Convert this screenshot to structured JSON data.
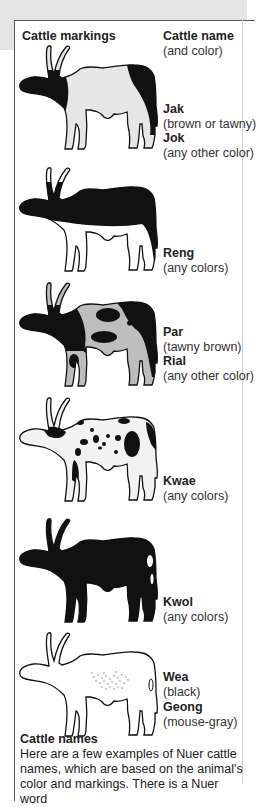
{
  "header": {
    "markings_label": "Cattle markings",
    "name_label": "Cattle name",
    "name_sublabel": "(and color)"
  },
  "cattle": [
    {
      "marking": "black head, neck, and rump with white body",
      "names": [
        {
          "name": "Jak",
          "color": "(brown or tawny)"
        },
        {
          "name": "Jok",
          "color": "(any other color)"
        }
      ]
    },
    {
      "marking": "dark back and head, white belly and legs",
      "names": [
        {
          "name": "Reng",
          "color": "(any colors)"
        }
      ]
    },
    {
      "marking": "large patches",
      "names": [
        {
          "name": "Par",
          "color": "(tawny brown)"
        },
        {
          "name": "Rial",
          "color": "(any other color)"
        }
      ]
    },
    {
      "marking": "small spots",
      "names": [
        {
          "name": "Kwae",
          "color": "(any colors)"
        }
      ]
    },
    {
      "marking": "solid dark with white flank spot",
      "names": [
        {
          "name": "Kwol",
          "color": "(any colors)"
        }
      ]
    },
    {
      "marking": "light with speckled flank",
      "names": [
        {
          "name": "Wea",
          "color": "(black)"
        },
        {
          "name": "Geong",
          "color": "(mouse-gray)"
        }
      ]
    }
  ],
  "caption": {
    "title": "Cattle names",
    "text": "Here are a few examples of Nuer cattle names, which are based on the animal's color and markings. There is a Nuer word"
  },
  "colors": {
    "black": "#111111",
    "light_gray": "#e6e6e6",
    "mid_gray": "#bdbdbd",
    "panel_border": "#555555",
    "top_band": "#e4e4e4"
  }
}
